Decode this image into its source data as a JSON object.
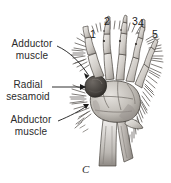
{
  "figure": {
    "panel_letter": "C",
    "background_color": "#ffffff",
    "ink_color": "#2b2b2b"
  },
  "labels": [
    {
      "id": "adductor",
      "line1": "Adductor",
      "line2": "muscle",
      "name": "label-adductor-muscle"
    },
    {
      "id": "radial_sesamoid",
      "line1": "Radial",
      "line2": "sesamoid",
      "name": "label-radial-sesamoid"
    },
    {
      "id": "abductor",
      "line1": "Abductor",
      "line2": "muscle",
      "name": "label-abductor-muscle"
    }
  ],
  "digits": [
    {
      "value": "1",
      "name": "digit-label-1"
    },
    {
      "value": "2",
      "name": "digit-label-2"
    },
    {
      "value": "3",
      "name": "digit-label-3"
    },
    {
      "value": "4",
      "name": "digit-label-4"
    },
    {
      "value": "5",
      "name": "digit-label-5"
    }
  ],
  "colors": {
    "bone_light": "#e8e6e3",
    "bone_mid": "#bdb9b4",
    "bone_shadow": "#8c8782",
    "sesamoid_dark": "#4a4642",
    "hatch": "#5c5954",
    "outline": "#3a3734"
  }
}
